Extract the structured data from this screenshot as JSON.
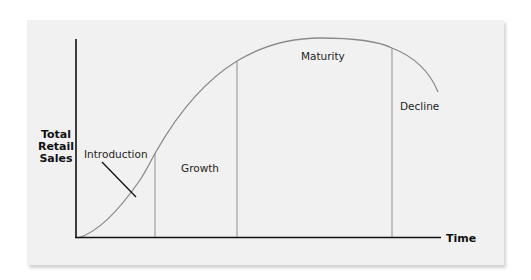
{
  "diagram": {
    "y_axis_label": [
      "Total",
      "Retail",
      "Sales"
    ],
    "x_axis_label": "Time",
    "stages": [
      {
        "name": "Introduction"
      },
      {
        "name": "Growth"
      },
      {
        "name": "Maturity"
      },
      {
        "name": "Decline"
      }
    ],
    "colors": {
      "background": "#f1f1f1",
      "axis": "#111111",
      "curve": "#8a8a8a",
      "divider": "#8e8e8e",
      "text": "#1e1e1e"
    }
  }
}
